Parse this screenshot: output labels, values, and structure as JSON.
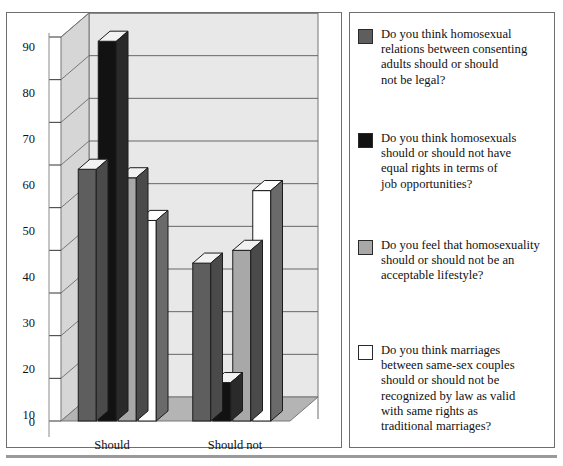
{
  "chart_data": {
    "type": "bar",
    "title": "",
    "subtitle": "",
    "xlabel": "",
    "ylabel": "",
    "categories": [
      "Should",
      "Should not"
    ],
    "ylim": [
      0,
      90
    ],
    "yticks": [
      0,
      10,
      20,
      30,
      40,
      50,
      60,
      70,
      80,
      90
    ],
    "ytick_labels": [
      "0",
      "10",
      "20",
      "30",
      "40",
      "50",
      "60",
      "70",
      "80",
      "90"
    ],
    "grid": true,
    "grid_axis": "y",
    "legend_position": "right",
    "three_d": true,
    "series": [
      {
        "name": "Do you think homosexual relations between consenting adults should or should not be legal?",
        "color": "#5e5e5e",
        "values": [
          59,
          37
        ]
      },
      {
        "name": "Do you think homosexuals should or should not have equal rights in terms of job opportunities?",
        "color": "#121212",
        "values": [
          89,
          9
        ]
      },
      {
        "name": "Do you feel that homosexuality should or should not be an acceptable lifestyle?",
        "color": "#a8a8a8",
        "values": [
          57,
          40
        ]
      },
      {
        "name": "Do you think marriages between same-sex couples should or should not be recognized by law as valid with same rights as traditional marriages?",
        "color": "#ffffff",
        "values": [
          47,
          54
        ]
      }
    ]
  },
  "legend": {
    "items": [
      {
        "swatch_name": "legend-swatch-dark-gray",
        "color": "#5e5e5e",
        "label": "Do you think homosexual\nrelations between consenting\nadults should or should\nnot be legal?"
      },
      {
        "swatch_name": "legend-swatch-black",
        "color": "#121212",
        "label": "Do you think homosexuals\nshould or should not have\nequal rights in terms of\njob opportunities?"
      },
      {
        "swatch_name": "legend-swatch-medium-gray",
        "color": "#a8a8a8",
        "label": "Do you feel that homosexuality\nshould or should not be an\nacceptable lifestyle?"
      },
      {
        "swatch_name": "legend-swatch-white",
        "color": "#ffffff",
        "label": "Do you think marriages\nbetween same-sex couples\nshould or should not be\nrecognized by law as valid\nwith same rights as\ntraditional marriages?"
      }
    ]
  },
  "axis": {
    "y_labels": [
      "90",
      "80",
      "70",
      "60",
      "50",
      "40",
      "30",
      "20",
      "10",
      "0"
    ],
    "x_labels": [
      "Should",
      "Should not"
    ]
  },
  "colors": {
    "plot_wall": "#e8e8e8",
    "plot_floor": "#b4b4b4",
    "plot_side": "#d6d6d6",
    "frame_border": "#6e6e6e",
    "gridline": "#555555",
    "bottom_rule": "#9a9a9a"
  }
}
